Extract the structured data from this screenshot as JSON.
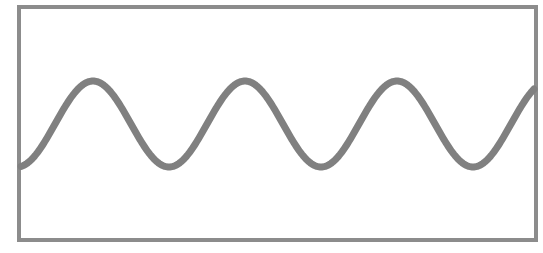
{
  "figure": {
    "frame": {
      "x": 19,
      "y": 7,
      "width": 517,
      "height": 233,
      "stroke": "#8c8c8c",
      "stroke_width": 4
    },
    "wave": {
      "stroke": "#808080",
      "stroke_width": 7,
      "centerline_y": 124,
      "amplitude": 43,
      "period": 152,
      "first_peak_x": 93,
      "x_start": 21,
      "x_end": 534
    }
  }
}
